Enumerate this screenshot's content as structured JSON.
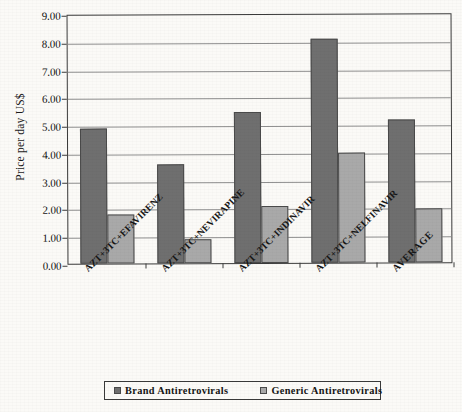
{
  "chart_data": {
    "type": "bar",
    "title": "",
    "subtitle": "",
    "xlabel": "",
    "ylabel": "Price per day US$",
    "ylim": [
      0,
      9
    ],
    "ytick_step": 1,
    "grid": true,
    "legend_position": "bottom",
    "ytick_labels": [
      "9.00",
      "8.00",
      "7.00",
      "6.00",
      "5.00",
      "4.00",
      "3.00",
      "2.00",
      "1.00",
      "0.00"
    ],
    "ytick_values": [
      9,
      8,
      7,
      6,
      5,
      4,
      3,
      2,
      1,
      0
    ],
    "categories": [
      "AZT+3TC+EFAVIRENZ",
      "AZT+3TC+NEVIRAPINE",
      "AZT+3TC+INDINAVIR",
      "AZT+3TC+NELFINAVIR",
      "AVERAGE"
    ],
    "series": [
      {
        "name": "Brand Antiretrovirals",
        "color": "#6f6f6f",
        "values": [
          4.85,
          3.55,
          5.45,
          8.05,
          5.15
        ]
      },
      {
        "name": "Generic Antiretrovirals",
        "color": "#a9a9a9",
        "values": [
          1.75,
          0.85,
          2.05,
          3.95,
          1.95
        ]
      }
    ]
  },
  "legend": {
    "items": [
      {
        "label": "Brand Antiretrovirals",
        "swatch": "brand-swatch-icon"
      },
      {
        "label": "Generic Antiretrovirals",
        "swatch": "generic-swatch-icon"
      }
    ]
  }
}
